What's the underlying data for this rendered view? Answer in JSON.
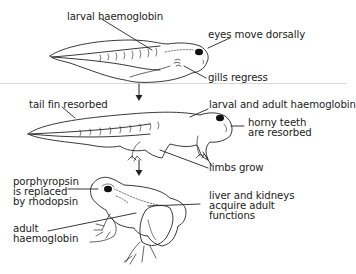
{
  "diagram": {
    "type": "metamorphosis-sequence",
    "stages": [
      {
        "id": "tadpole",
        "labels": {
          "larval_haemoglobin": "larval haemoglobin",
          "eyes_move_dorsally": "eyes move dorsally",
          "gills_regress": "gills regress"
        }
      },
      {
        "id": "froglet",
        "labels": {
          "tail_fin_resorbed": "tail fin resorbed",
          "larval_and_adult_haemoglobin": "larval and adult haemoglobin",
          "horny_teeth_line1": "horny teeth",
          "horny_teeth_line2": "are resorbed",
          "limbs_grow": "limbs grow"
        }
      },
      {
        "id": "frog",
        "labels": {
          "porphyropsin_line1": "porphyropsin",
          "porphyropsin_line2": "is replaced",
          "porphyropsin_line3": "by rhodopsin",
          "adult_line1": "adult",
          "adult_line2": "haemoglobin",
          "liver_line1": "liver and kidneys",
          "liver_line2": "acquire adult",
          "liver_line3": "functions"
        }
      }
    ],
    "arrows": [
      {
        "from": "tadpole",
        "to": "froglet",
        "icon": "arrow-down-icon"
      },
      {
        "from": "froglet",
        "to": "frog",
        "icon": "arrow-down-icon"
      }
    ],
    "colors": {
      "line": "#222222",
      "background": "#ffffff",
      "divider": "#d8d8d8"
    }
  }
}
